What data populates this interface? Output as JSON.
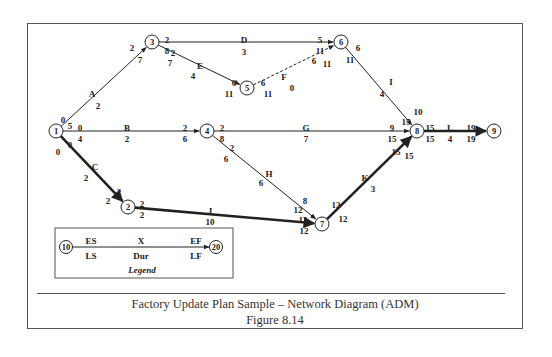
{
  "figure": {
    "title": "Factory Update Plan Sample – Network Diagram (ADM)",
    "number": "Figure 8.14"
  },
  "nodes": [
    {
      "id": "1",
      "x": 56,
      "y": 131
    },
    {
      "id": "2",
      "x": 128,
      "y": 207
    },
    {
      "id": "3",
      "x": 152,
      "y": 42
    },
    {
      "id": "4",
      "x": 207,
      "y": 131
    },
    {
      "id": "5",
      "x": 247,
      "y": 88
    },
    {
      "id": "6",
      "x": 341,
      "y": 42
    },
    {
      "id": "7",
      "x": 322,
      "y": 224
    },
    {
      "id": "8",
      "x": 417,
      "y": 131
    },
    {
      "id": "9",
      "x": 494,
      "y": 131
    }
  ],
  "activities": [
    {
      "name": "A",
      "from": "1",
      "to": "3",
      "duration": "2",
      "ES": "0",
      "LS": "5",
      "EF": "2",
      "LF": "7",
      "critical": false,
      "dummy": false
    },
    {
      "name": "B",
      "from": "1",
      "to": "4",
      "duration": "2",
      "ES": "0",
      "LS": "4",
      "EF": "2",
      "LF": "6",
      "critical": false,
      "dummy": false
    },
    {
      "name": "C",
      "from": "1",
      "to": "2",
      "duration": "2",
      "ES": "0",
      "LS": "0",
      "EF": "2",
      "LF": "2",
      "critical": true,
      "dummy": false
    },
    {
      "name": "D",
      "from": "3",
      "to": "6",
      "duration": "3",
      "ES": "2",
      "LS": "8",
      "EF": "5",
      "LF": "11",
      "critical": false,
      "dummy": false
    },
    {
      "name": "E",
      "from": "3",
      "to": "5",
      "duration": "4",
      "ES": "2",
      "LS": "7",
      "EF": "6",
      "LF": "11",
      "critical": false,
      "dummy": false
    },
    {
      "name": "F",
      "from": "5",
      "to": "6",
      "duration": "0",
      "ES": "6",
      "LS": "11",
      "EF": "6",
      "LF": "11",
      "critical": false,
      "dummy": true
    },
    {
      "name": "G",
      "from": "4",
      "to": "8",
      "duration": "7",
      "ES": "2",
      "LS": "8",
      "EF": "9",
      "LF": "15",
      "critical": false,
      "dummy": false
    },
    {
      "name": "H",
      "from": "4",
      "to": "7",
      "duration": "6",
      "ES": "2",
      "LS": "6",
      "EF": "8",
      "LF": "12",
      "critical": false,
      "dummy": false
    },
    {
      "name": "I",
      "from": "6",
      "to": "8",
      "duration": "4",
      "ES": "6",
      "LS": "11",
      "EF": "10",
      "LF": "15",
      "critical": false,
      "dummy": false
    },
    {
      "name": "J",
      "from": "2",
      "to": "7",
      "duration": "10",
      "ES": "2",
      "LS": "2",
      "EF": "12",
      "LF": "12",
      "critical": true,
      "dummy": false
    },
    {
      "name": "K",
      "from": "7",
      "to": "8",
      "duration": "3",
      "ES": "12",
      "LS": "12",
      "EF": "15",
      "LF": "15",
      "critical": true,
      "dummy": false
    },
    {
      "name": "L",
      "from": "8",
      "to": "9",
      "duration": "4",
      "ES": "15",
      "LS": "15",
      "EF": "19",
      "LF": "19",
      "critical": true,
      "dummy": false
    }
  ],
  "legend": {
    "title": "Legend",
    "start_node": "10",
    "end_node": "20",
    "es": "ES",
    "ls": "LS",
    "activity": "X",
    "duration": "Dur",
    "ef": "EF",
    "lf": "LF"
  }
}
